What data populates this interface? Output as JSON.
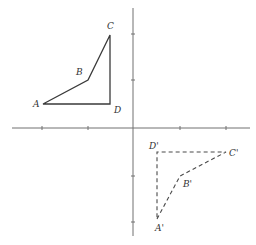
{
  "diagram": {
    "type": "coordinate-plane-rotation",
    "colors": {
      "axis": "#707070",
      "shape": "#3a3a3a",
      "image": "#4a4a4a",
      "label": "#333333"
    },
    "axes": {
      "x_ticks": [
        42,
        88,
        180,
        226
      ],
      "y_ticks": [
        34,
        80,
        176,
        222
      ]
    },
    "original": {
      "style": "solid",
      "points": [
        {
          "name": "A",
          "label": "A",
          "x": 43,
          "y": 104,
          "lx": 33,
          "ly": 107
        },
        {
          "name": "B",
          "label": "B",
          "x": 88,
          "y": 80,
          "lx": 76,
          "ly": 75
        },
        {
          "name": "C",
          "label": "C",
          "x": 110,
          "y": 35,
          "lx": 107,
          "ly": 29
        },
        {
          "name": "D",
          "label": "D",
          "x": 110,
          "y": 104,
          "lx": 114,
          "ly": 113
        }
      ]
    },
    "image": {
      "style": "dashed",
      "points": [
        {
          "name": "A'",
          "label": "A'",
          "x": 157,
          "y": 219,
          "lx": 155,
          "ly": 231
        },
        {
          "name": "B'",
          "label": "B'",
          "x": 180,
          "y": 176,
          "lx": 183,
          "ly": 187
        },
        {
          "name": "C'",
          "label": "C'",
          "x": 226,
          "y": 152,
          "lx": 229,
          "ly": 156
        },
        {
          "name": "D'",
          "label": "D'",
          "x": 157,
          "y": 152,
          "lx": 149,
          "ly": 149
        }
      ]
    }
  }
}
